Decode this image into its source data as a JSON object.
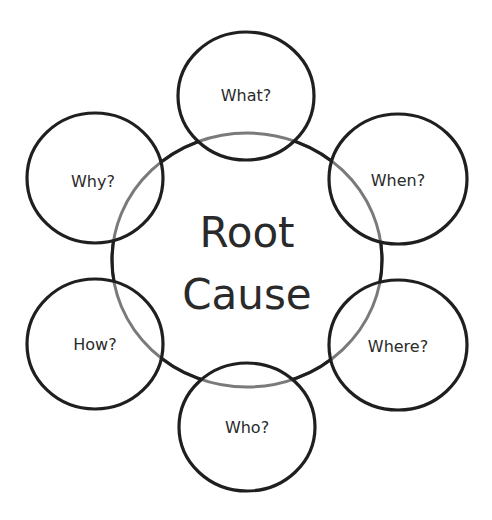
{
  "diagram": {
    "type": "hub-and-spoke",
    "background": "#ffffff",
    "stroke_color": "#1f1f1f",
    "inner_stroke_color": "#7a7a7a",
    "center": {
      "line1": "Root",
      "line2": "Cause"
    },
    "nodes": [
      {
        "id": "what",
        "label": "What?"
      },
      {
        "id": "when",
        "label": "When?"
      },
      {
        "id": "where",
        "label": "Where?"
      },
      {
        "id": "who",
        "label": "Who?"
      },
      {
        "id": "how",
        "label": "How?"
      },
      {
        "id": "why",
        "label": "Why?"
      }
    ]
  }
}
